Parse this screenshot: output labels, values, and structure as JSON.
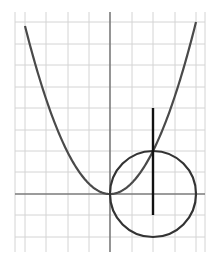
{
  "diagram": {
    "grid": {
      "x_min": 15,
      "x_max": 205,
      "y_min": 12,
      "y_max": 252,
      "vlines": [
        25,
        46,
        68,
        89,
        132,
        153,
        175,
        196
      ],
      "hlines": [
        22,
        44,
        65,
        87,
        108,
        130,
        151,
        172,
        215,
        237
      ],
      "color": "#d4d4d4"
    },
    "axes": {
      "origin_x": 110,
      "origin_y": 194,
      "color": "#7a7a7a"
    },
    "parabola": {
      "vertex_x": 110,
      "vertex_y": 194,
      "unit_px": 43,
      "x_from": 25,
      "x_to": 196,
      "color": "#4a4a4a"
    },
    "circle": {
      "cx": 153,
      "cy": 194,
      "r": 43,
      "color": "#333333"
    },
    "segment": {
      "x": 153,
      "y1": 108,
      "y2": 215,
      "color": "#111111"
    }
  }
}
